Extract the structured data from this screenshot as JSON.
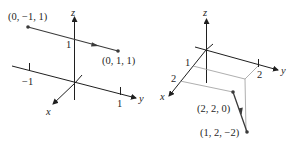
{
  "figures": [
    {
      "id": "left",
      "axes": {
        "x": "x",
        "y": "y",
        "z": "z"
      },
      "ticks": {
        "z": "1",
        "y_neg": "−1",
        "y_pos": "1"
      },
      "points": [
        {
          "label": "(0, −1, 1)"
        },
        {
          "label": "(0, 1, 1)"
        }
      ]
    },
    {
      "id": "right",
      "axes": {
        "x": "x",
        "y": "y",
        "z": "z"
      },
      "ticks": {
        "x1": "1",
        "x2": "2",
        "y2": "2"
      },
      "points": [
        {
          "label": "(2, 2, 0)"
        },
        {
          "label": "(1, 2, −2)"
        }
      ]
    }
  ],
  "colors": {
    "ink": "#1f1f1f",
    "vector": "#3a3a3a",
    "guide": "#9a9a9a"
  }
}
